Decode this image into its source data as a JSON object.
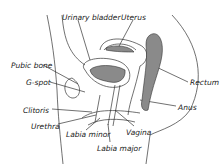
{
  "diagram": {
    "colors": {
      "line": "#333333",
      "fill": "#8a8a8a",
      "background": "#ffffff"
    },
    "labels": [
      {
        "id": "urinary-bladder",
        "text": "Urinary bladder",
        "x": 62,
        "y": 14
      },
      {
        "id": "uterus",
        "text": "Uterus",
        "x": 121,
        "y": 14
      },
      {
        "id": "pubic-bone",
        "text": "Pubic bone",
        "x": 11,
        "y": 62
      },
      {
        "id": "g-spot",
        "text": "G-spot",
        "x": 26,
        "y": 79
      },
      {
        "id": "rectum",
        "text": "Rectum",
        "x": 190,
        "y": 79
      },
      {
        "id": "clitoris",
        "text": "Clitoris",
        "x": 23,
        "y": 107
      },
      {
        "id": "anus",
        "text": "Anus",
        "x": 178,
        "y": 104
      },
      {
        "id": "urethra",
        "text": "Urethra",
        "x": 31,
        "y": 123
      },
      {
        "id": "labia-minor",
        "text": "Labia minor",
        "x": 66,
        "y": 131
      },
      {
        "id": "vagina",
        "text": "Vagina",
        "x": 126,
        "y": 129
      },
      {
        "id": "labia-major",
        "text": "Labia major",
        "x": 97,
        "y": 145
      }
    ]
  }
}
